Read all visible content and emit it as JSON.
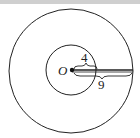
{
  "diagram": {
    "center_label": "O",
    "inner_radius_label": "4",
    "outer_radius_label": "9",
    "stroke_color": "#222222",
    "background": "#ffffff"
  }
}
